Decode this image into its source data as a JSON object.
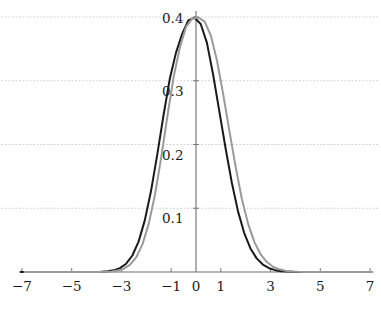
{
  "figure": {
    "background_color": "#ffffff",
    "axis_color": "#6e6e6e",
    "grid_color": "#c9c9c9",
    "label_color": "#1a1a1a",
    "clipped_top_text": ""
  },
  "chart_data": {
    "type": "line",
    "title": "",
    "subtitle": "",
    "xlabel": "",
    "ylabel": "",
    "xlim": [
      -7,
      7
    ],
    "ylim": [
      0,
      0.42
    ],
    "grid": true,
    "grid_axis": "y",
    "grid_style": "dotted",
    "legend": "none",
    "x_ticks": [
      -7,
      -5,
      -3,
      -1,
      0,
      1,
      3,
      5,
      7
    ],
    "x_tick_labels": [
      "−7",
      "−5",
      "−3",
      "−1",
      "0",
      "1",
      "3",
      "5",
      "7"
    ],
    "y_ticks": [
      0.1,
      0.2,
      0.3,
      0.4
    ],
    "y_tick_labels": [
      "0.1",
      "0.2",
      "0.3",
      "0.4"
    ],
    "x": [
      -7.0,
      -6.75,
      -6.5,
      -6.25,
      -6.0,
      -5.75,
      -5.5,
      -5.25,
      -5.0,
      -4.75,
      -4.5,
      -4.25,
      -4.0,
      -3.75,
      -3.5,
      -3.25,
      -3.0,
      -2.75,
      -2.5,
      -2.25,
      -2.0,
      -1.75,
      -1.5,
      -1.25,
      -1.0,
      -0.75,
      -0.5,
      -0.25,
      0.0,
      0.25,
      0.5,
      0.75,
      1.0,
      1.25,
      1.5,
      1.75,
      2.0,
      2.25,
      2.5,
      2.75,
      3.0,
      3.25,
      3.5,
      3.75,
      4.0,
      4.25,
      4.5,
      4.75,
      5.0,
      5.25,
      5.5,
      5.75,
      6.0,
      6.25,
      6.5,
      6.75,
      7.0
    ],
    "series": [
      {
        "name": "curve-black",
        "color": "#1a1a1a",
        "width": 2.0,
        "peak_x": -0.06,
        "peak_y": 0.4,
        "values": [
          0.0,
          0.0,
          0.0,
          0.0,
          0.0,
          0.0,
          0.0,
          0.0,
          0.0,
          0.0,
          0.0,
          4e-05,
          0.00013,
          0.00038,
          0.00104,
          0.00261,
          0.00606,
          0.01303,
          0.02591,
          0.04766,
          0.08098,
          0.12697,
          0.18363,
          0.24509,
          0.30181,
          0.34333,
          0.37321,
          0.39457,
          0.39894,
          0.38896,
          0.35934,
          0.30943,
          0.25158,
          0.19418,
          0.14033,
          0.09509,
          0.06102,
          0.03701,
          0.02134,
          0.01164,
          0.00598,
          0.00292,
          0.00135,
          0.00059,
          0.00024,
          9e-05,
          3e-05,
          1e-05,
          0.0,
          0.0,
          0.0,
          0.0,
          0.0,
          0.0,
          0.0,
          0.0,
          0.0
        ]
      },
      {
        "name": "curve-gray",
        "color": "#9a9a9a",
        "width": 2.0,
        "peak_x": 0.1,
        "peak_y": 0.4,
        "values": [
          0.0,
          0.0,
          0.0,
          0.0,
          0.0,
          0.0,
          0.0,
          0.0,
          0.0,
          0.0,
          0.0,
          3e-05,
          0.0001,
          0.0003,
          0.00085,
          0.00219,
          0.00521,
          0.01145,
          0.02325,
          0.04371,
          0.07587,
          0.12136,
          0.17937,
          0.24442,
          0.30583,
          0.35207,
          0.38453,
          0.39776,
          0.39894,
          0.3928,
          0.37058,
          0.33062,
          0.27737,
          0.2199,
          0.16362,
          0.11377,
          0.07511,
          0.0469,
          0.0278,
          0.01561,
          0.00827,
          0.00415,
          0.00197,
          0.00088,
          0.00037,
          0.00015,
          6e-05,
          2e-05,
          0.0,
          0.0,
          0.0,
          0.0,
          0.0,
          0.0,
          0.0,
          0.0,
          0.0
        ]
      }
    ]
  },
  "axes": {
    "x_axis_name": "x-axis-line",
    "y_axis_name": "y-axis-line"
  }
}
